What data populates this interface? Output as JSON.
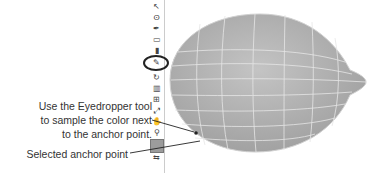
{
  "callouts": {
    "eyedropper": {
      "line1": "Use the Eyedropper tool",
      "line2": "to sample the color next",
      "line3": "to the anchor point."
    },
    "anchor": {
      "line1": "Selected anchor point"
    }
  },
  "toolbar": {
    "tools": [
      {
        "name": "selection-tool-icon",
        "glyph": "↖"
      },
      {
        "name": "lasso-tool-icon",
        "glyph": "ʘ"
      },
      {
        "name": "pen-tool-icon",
        "glyph": "✒"
      },
      {
        "name": "rectangle-tool-icon",
        "glyph": "▭"
      },
      {
        "name": "paintbrush-tool-icon",
        "glyph": "▮"
      },
      {
        "name": "eyedropper-tool-icon",
        "glyph": "✎"
      },
      {
        "name": "rotate-tool-icon",
        "glyph": "↻"
      },
      {
        "name": "graph-tool-icon",
        "glyph": "▥"
      },
      {
        "name": "mesh-tool-icon",
        "glyph": "⊞"
      },
      {
        "name": "blend-tool-icon",
        "glyph": "⤢"
      },
      {
        "name": "hand-tool-icon",
        "glyph": "✋"
      },
      {
        "name": "zoom-tool-icon",
        "glyph": "⚲"
      },
      {
        "name": "swap-colors-icon",
        "glyph": "⇆"
      }
    ],
    "highlighted_tool": "eyedropper-tool-icon",
    "fill_color": "#9c9c9c"
  },
  "artwork": {
    "object": "lemon",
    "mesh": "gradient mesh grid",
    "fill_color": "#b5b5b5",
    "grid_color": "#e6e6e6"
  }
}
